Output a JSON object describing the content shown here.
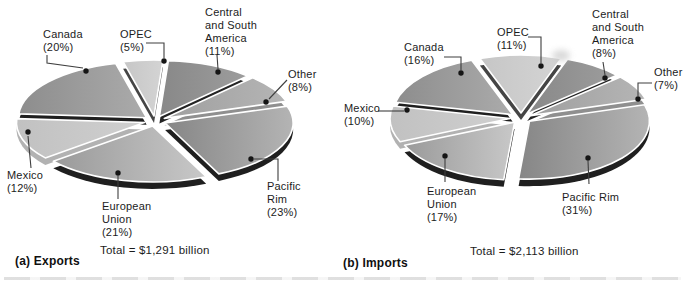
{
  "page": {
    "background": "#ffffff",
    "leader_line_color": "#3f3f3f",
    "leader_dot_color": "#151515",
    "text_color": "#1c1c1c"
  },
  "chart_data": [
    {
      "type": "pie",
      "id": "exports",
      "title": "(a) Exports",
      "total": "Total = $1,291 billion",
      "slices": [
        {
          "name": "Canada",
          "pct": 20,
          "label_text": "Canada\n(20%)",
          "fill": [
            "#8d8d8d",
            "#ababab"
          ],
          "side": "#1f1f1f"
        },
        {
          "name": "OPEC",
          "pct": 5,
          "label_text": "OPEC\n(5%)",
          "fill": [
            "#c6c6c6",
            "#d4d4d4"
          ],
          "side": "#454545"
        },
        {
          "name": "Central and South America",
          "pct": 11,
          "label_text": "Central\nand South\nAmerica\n(11%)",
          "fill": [
            "#888888",
            "#9d9d9d"
          ],
          "side": "#242424"
        },
        {
          "name": "Other",
          "pct": 8,
          "label_text": "Other\n(8%)",
          "fill": [
            "#9f9f9f",
            "#b5b5b5"
          ],
          "side": "#8f8f8f"
        },
        {
          "name": "Pacific Rim",
          "pct": 23,
          "label_text": "Pacific\nRim\n(23%)",
          "fill": [
            "#868686",
            "#b4b4b4"
          ],
          "side": "#1f1f1f"
        },
        {
          "name": "European Union",
          "pct": 21,
          "label_text": "European\nUnion\n(21%)",
          "fill": [
            "#9a9a9a",
            "#c8c8c8"
          ],
          "side": "#1f1f1f"
        },
        {
          "name": "Mexico",
          "pct": 12,
          "label_text": "Mexico\n(12%)",
          "fill": [
            "#c1c1c1",
            "#d0d0d0"
          ],
          "side": "#b2b2b2"
        }
      ]
    },
    {
      "type": "pie",
      "id": "imports",
      "title": "(b) Imports",
      "total": "Total = $2,113 billion",
      "slices": [
        {
          "name": "Canada",
          "pct": 16,
          "label_text": "Canada\n(16%)",
          "fill": [
            "#8d8d8d",
            "#ababab"
          ],
          "side": "#1f1f1f"
        },
        {
          "name": "OPEC",
          "pct": 11,
          "label_text": "OPEC\n(11%)",
          "fill": [
            "#c6c6c6",
            "#d4d4d4"
          ],
          "side": "#454545"
        },
        {
          "name": "Central and South America",
          "pct": 8,
          "label_text": "Central\nand South\nAmerica\n(8%)",
          "fill": [
            "#888888",
            "#9d9d9d"
          ],
          "side": "#242424"
        },
        {
          "name": "Other",
          "pct": 7,
          "label_text": "Other\n(7%)",
          "fill": [
            "#9f9f9f",
            "#b5b5b5"
          ],
          "side": "#8f8f8f"
        },
        {
          "name": "Pacific Rim",
          "pct": 31,
          "label_text": "Pacific Rim\n(31%)",
          "fill": [
            "#868686",
            "#b4b4b4"
          ],
          "side": "#1f1f1f"
        },
        {
          "name": "European Union",
          "pct": 17,
          "label_text": "European\nUnion\n(17%)",
          "fill": [
            "#9a9a9a",
            "#c8c8c8"
          ],
          "side": "#1f1f1f"
        },
        {
          "name": "Mexico",
          "pct": 10,
          "label_text": "Mexico\n(10%)",
          "fill": [
            "#c1c1c1",
            "#d0d0d0"
          ],
          "side": "#b2b2b2"
        }
      ]
    }
  ]
}
